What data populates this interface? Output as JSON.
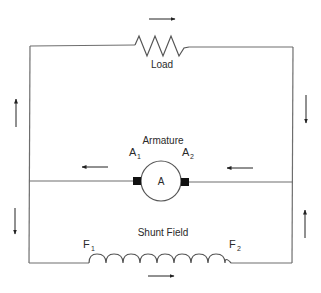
{
  "diagram": {
    "labels": {
      "load": "Load",
      "armature": "Armature",
      "armature_symbol": "A",
      "a1_base": "A",
      "a1_sub": "1",
      "a2_base": "A",
      "a2_sub": "2",
      "shunt_field": "Shunt Field",
      "f1_base": "F",
      "f1_sub": "1",
      "f2_base": "F",
      "f2_sub": "2"
    },
    "components": [
      {
        "id": "load",
        "type": "resistor",
        "label": "Load"
      },
      {
        "id": "armature",
        "type": "armature",
        "label": "Armature",
        "terminals": [
          "A1",
          "A2"
        ]
      },
      {
        "id": "shunt-field",
        "type": "inductor-coil",
        "label": "Shunt Field",
        "terminals": [
          "F1",
          "F2"
        ]
      }
    ],
    "current_arrows": [
      {
        "location": "top-load",
        "direction": "right"
      },
      {
        "location": "left-upper",
        "direction": "up"
      },
      {
        "location": "right-upper",
        "direction": "down"
      },
      {
        "location": "armature-left",
        "direction": "left"
      },
      {
        "location": "armature-right",
        "direction": "left"
      },
      {
        "location": "left-lower",
        "direction": "down"
      },
      {
        "location": "right-lower",
        "direction": "up"
      },
      {
        "location": "bottom-field",
        "direction": "right"
      }
    ],
    "colors": {
      "wire": "#6e6e6e",
      "arrow": "#222222",
      "text": "#2a2a2a",
      "brush": "#111111",
      "rule": "#222222"
    }
  }
}
